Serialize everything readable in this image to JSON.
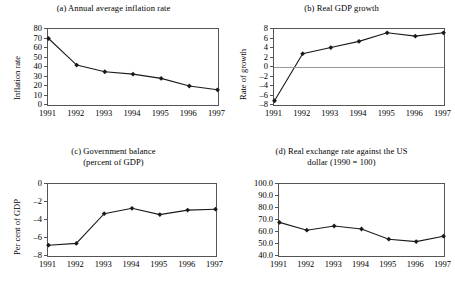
{
  "figure": {
    "background": "#ffffff",
    "line_color": "#1a1a1a",
    "axis_color": "#555555",
    "zero_line_color": "#999999"
  },
  "chart_data": [
    {
      "id": "a",
      "type": "line",
      "title": "(a) Annual average inflation rate",
      "xlabel": "",
      "ylabel": "Inflation rate",
      "categories": [
        "1991",
        "1992",
        "1993",
        "1994",
        "1995",
        "1996",
        "1997"
      ],
      "values": [
        70,
        42,
        35,
        32.5,
        28,
        20,
        16
      ],
      "yticks": [
        80,
        70,
        60,
        50,
        40,
        30,
        20,
        10,
        0
      ],
      "ylim": [
        0,
        80
      ],
      "grid": false,
      "legend": "none",
      "marker": "diamond"
    },
    {
      "id": "b",
      "type": "line",
      "title": "(b) Real GDP growth",
      "xlabel": "",
      "ylabel": "Rate of growth",
      "categories": [
        "1991",
        "1992",
        "1993",
        "1994",
        "1995",
        "1996",
        "1997"
      ],
      "values": [
        -7.1,
        2.8,
        4.1,
        5.4,
        7.2,
        6.5,
        7.2
      ],
      "yticks": [
        8,
        6,
        4,
        2,
        0,
        -2,
        -4,
        -6,
        -8
      ],
      "ylim": [
        -8,
        8
      ],
      "zero_line": 0,
      "grid": false,
      "legend": "none",
      "marker": "diamond"
    },
    {
      "id": "c",
      "type": "line",
      "title": "(c) Government balance\n(percent of GDP)",
      "xlabel": "",
      "ylabel": "Per cent of GDP",
      "categories": [
        "1991",
        "1992",
        "1993",
        "1994",
        "1995",
        "1996",
        "1997"
      ],
      "values": [
        -6.8,
        -6.6,
        -3.3,
        -2.7,
        -3.4,
        -2.9,
        -2.8
      ],
      "yticks": [
        0,
        -2,
        -4,
        -6,
        -8
      ],
      "ylim": [
        -8,
        0
      ],
      "grid": false,
      "legend": "none",
      "marker": "diamond"
    },
    {
      "id": "d",
      "type": "line",
      "title": "(d) Real exchange rate against the US\ndollar (1990 = 100)",
      "xlabel": "",
      "ylabel": "",
      "categories": [
        "1991",
        "1992",
        "1993",
        "1994",
        "1995",
        "1996",
        "1997"
      ],
      "values": [
        68.0,
        61.5,
        65.0,
        62.5,
        54.0,
        52.0,
        56.5
      ],
      "yticks": [
        "100.0",
        "90.0",
        "80.0",
        "70.0",
        "60.0",
        "50.0",
        "40.0"
      ],
      "ylim": [
        40,
        100
      ],
      "grid": false,
      "legend": "none",
      "marker": "diamond"
    }
  ]
}
